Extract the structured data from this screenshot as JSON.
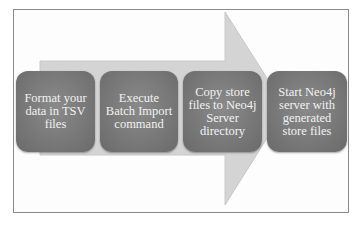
{
  "diagram": {
    "type": "process-flow",
    "arrow_color": "#d4d4d4",
    "box_color": "#7a7a7a",
    "text_color": "#f2f2f2",
    "steps": [
      {
        "label": "Format your data in TSV files"
      },
      {
        "label": "Execute Batch Import command"
      },
      {
        "label": "Copy store files to Neo4j Server directory"
      },
      {
        "label": "Start Neo4j server with generated store files"
      }
    ]
  }
}
